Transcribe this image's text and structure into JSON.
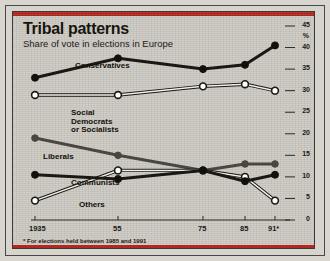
{
  "title": "Tribal patterns",
  "subtitle": "Share of vote in elections in Europe",
  "footnote": "* For elections held between 1985 and 1991",
  "colors": {
    "accent": "#b3281e",
    "paper": "#cfccc5",
    "ink": "#17150f",
    "line_dark": "#1a1813",
    "line_mid": "#4a473f",
    "marker_open": "#ffffff"
  },
  "axis": {
    "y_unit": "%",
    "y_ticks": [
      "0",
      "5",
      "10",
      "15",
      "20",
      "25",
      "30",
      "35",
      "40",
      "45"
    ],
    "x_ticks": [
      "1935",
      "55",
      "75",
      "85",
      "91*"
    ]
  },
  "labels": {
    "conservatives": "Conservatives",
    "social_line1": "Social",
    "social_line2": "Democrats",
    "social_line3": "or Socialists",
    "liberals": "Liberals",
    "communists": "Communists",
    "others": "Others"
  },
  "chart_data": {
    "type": "line",
    "title": "Tribal patterns",
    "subtitle": "Share of vote in elections in Europe",
    "xlabel": "",
    "ylabel": "%",
    "ylim": [
      0,
      45
    ],
    "grid": false,
    "legend": "inline-annotations",
    "x": [
      "1935",
      "55",
      "75",
      "85",
      "91*"
    ],
    "x_numeric": [
      1935,
      1955,
      1975,
      1985,
      1991
    ],
    "series": [
      {
        "name": "Conservatives",
        "marker": "filled",
        "values": [
          33,
          37.5,
          35,
          36,
          40.5
        ]
      },
      {
        "name": "Social Democrats or Socialists",
        "marker": "open",
        "values": [
          29,
          29,
          31,
          31.5,
          30
        ]
      },
      {
        "name": "Liberals",
        "marker": "filled-grey",
        "values": [
          19,
          15,
          11.5,
          13,
          13
        ]
      },
      {
        "name": "Communists",
        "marker": "open",
        "values": [
          4.5,
          11.5,
          11.5,
          10,
          4.5
        ]
      },
      {
        "name": "Others",
        "marker": "filled",
        "values": [
          10.5,
          9.5,
          11.5,
          9,
          10.5
        ]
      }
    ],
    "note": "* For elections held between 1985 and 1991"
  }
}
